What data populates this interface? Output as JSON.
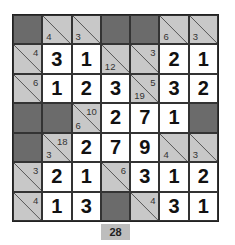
{
  "puzzle": {
    "type": "kakuro",
    "rows": 7,
    "cols": 7,
    "colors": {
      "dark": "#6b6b6b",
      "clue": "#c8c8c8",
      "white": "#ffffff"
    },
    "cells": [
      [
        {
          "t": "dark"
        },
        {
          "t": "clue",
          "down": "4"
        },
        {
          "t": "clue",
          "down": "3"
        },
        {
          "t": "dark"
        },
        {
          "t": "dark"
        },
        {
          "t": "clue",
          "down": "6"
        },
        {
          "t": "clue",
          "down": "3"
        }
      ],
      [
        {
          "t": "clue",
          "right": "4"
        },
        {
          "t": "white",
          "v": "3"
        },
        {
          "t": "white",
          "v": "1"
        },
        {
          "t": "clue",
          "down": "12"
        },
        {
          "t": "clue",
          "right": "3"
        },
        {
          "t": "white",
          "v": "2"
        },
        {
          "t": "white",
          "v": "1"
        }
      ],
      [
        {
          "t": "clue",
          "right": "6"
        },
        {
          "t": "white",
          "v": "1"
        },
        {
          "t": "white",
          "v": "2"
        },
        {
          "t": "white",
          "v": "3"
        },
        {
          "t": "clue",
          "down": "19",
          "right": "5"
        },
        {
          "t": "white",
          "v": "3"
        },
        {
          "t": "white",
          "v": "2"
        }
      ],
      [
        {
          "t": "dark"
        },
        {
          "t": "dark"
        },
        {
          "t": "clue",
          "down": "6",
          "right": "10"
        },
        {
          "t": "white",
          "v": "2"
        },
        {
          "t": "white",
          "v": "7"
        },
        {
          "t": "white",
          "v": "1"
        },
        {
          "t": "dark"
        }
      ],
      [
        {
          "t": "dark"
        },
        {
          "t": "clue",
          "down": "3",
          "right": "18"
        },
        {
          "t": "white",
          "v": "2"
        },
        {
          "t": "white",
          "v": "7"
        },
        {
          "t": "white",
          "v": "9"
        },
        {
          "t": "clue",
          "down": "4"
        },
        {
          "t": "clue",
          "down": "3"
        }
      ],
      [
        {
          "t": "clue",
          "right": "3"
        },
        {
          "t": "white",
          "v": "2"
        },
        {
          "t": "white",
          "v": "1"
        },
        {
          "t": "clue",
          "right": "6"
        },
        {
          "t": "white",
          "v": "3"
        },
        {
          "t": "white",
          "v": "1"
        },
        {
          "t": "white",
          "v": "2"
        }
      ],
      [
        {
          "t": "clue",
          "right": "4"
        },
        {
          "t": "white",
          "v": "1"
        },
        {
          "t": "white",
          "v": "3"
        },
        {
          "t": "dark"
        },
        {
          "t": "clue",
          "right": "4"
        },
        {
          "t": "white",
          "v": "3"
        },
        {
          "t": "white",
          "v": "1"
        }
      ]
    ]
  },
  "footer": {
    "label": "28"
  }
}
